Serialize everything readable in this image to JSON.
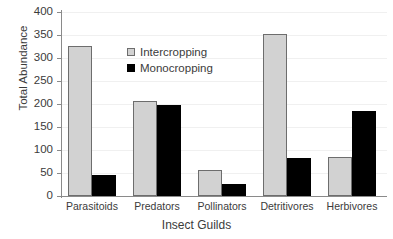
{
  "chart_data": {
    "type": "bar",
    "title": "",
    "xlabel": "Insect Guilds",
    "ylabel": "Total Abundance",
    "categories": [
      "Parasitoids",
      "Predators",
      "Pollinators",
      "Detritivores",
      "Herbivores"
    ],
    "series": [
      {
        "name": "Intercropping",
        "color": "#d2d2d2",
        "values": [
          327,
          207,
          57,
          353,
          85
        ]
      },
      {
        "name": "Monocropping",
        "color": "#000000",
        "values": [
          46,
          197,
          27,
          83,
          185
        ]
      }
    ],
    "ylim": [
      0,
      400
    ],
    "yticks": [
      0,
      50,
      100,
      150,
      200,
      250,
      300,
      350,
      400
    ],
    "ytick_labels": [
      "0",
      "50",
      "100",
      "150",
      "200",
      "250",
      "300",
      "350",
      "400"
    ],
    "grid": "horizontal",
    "legend_position": "upper-center-left",
    "frame": "left-bottom-only"
  },
  "legend": {
    "items": [
      {
        "label": "Intercropping"
      },
      {
        "label": "Monocropping"
      }
    ]
  }
}
